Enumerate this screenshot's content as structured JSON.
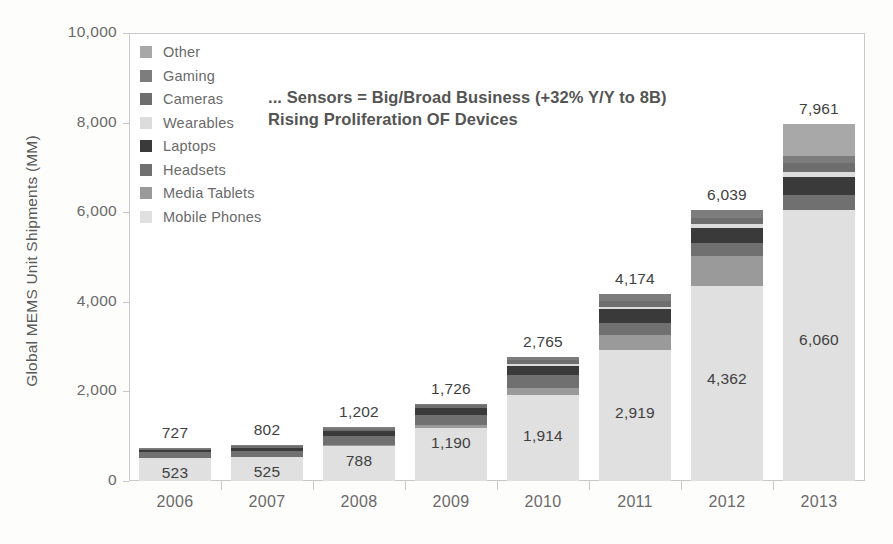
{
  "headline": {
    "line1": "... Sensors = Big/Broad Business (+32% Y/Y to 8B)",
    "line2": "Rising Proliferation OF Devices"
  },
  "legend": {
    "items": [
      {
        "label": "Other",
        "color": "#a8a8a8"
      },
      {
        "label": "Gaming",
        "color": "#7d7d7d"
      },
      {
        "label": "Cameras",
        "color": "#6e6e6e"
      },
      {
        "label": "Wearables",
        "color": "#dcdcdc"
      },
      {
        "label": "Laptops",
        "color": "#3a3a3a"
      },
      {
        "label": "Headsets",
        "color": "#707070"
      },
      {
        "label": "Media Tablets",
        "color": "#9a9a9a"
      },
      {
        "label": "Mobile Phones",
        "color": "#e0e0e0"
      }
    ]
  },
  "chart_data": {
    "type": "bar",
    "stacked": true,
    "title": "... Sensors = Big/Broad Business (+32% Y/Y to 8B) Rising Proliferation OF Devices",
    "xlabel": "",
    "ylabel": "Global MEMS Unit Shipments (MM)",
    "ylim": [
      0,
      10000
    ],
    "yticks": [
      0,
      2000,
      4000,
      6000,
      8000,
      10000
    ],
    "ytick_labels": [
      "0",
      "2,000",
      "4,000",
      "6,000",
      "8,000",
      "10,000"
    ],
    "grid": false,
    "legend_position": "upper-left inside",
    "categories": [
      "2006",
      "2007",
      "2008",
      "2009",
      "2010",
      "2011",
      "2012",
      "2013"
    ],
    "series": [
      {
        "name": "Mobile Phones",
        "color": "#e0e0e0",
        "values": [
          523,
          525,
          788,
          1190,
          1914,
          2919,
          4362,
          6060
        ]
      },
      {
        "name": "Media Tablets",
        "color": "#9a9a9a",
        "values": [
          0,
          0,
          20,
          60,
          160,
          330,
          660,
          0
        ]
      },
      {
        "name": "Headsets",
        "color": "#707070",
        "values": [
          120,
          150,
          190,
          230,
          300,
          280,
          300,
          330
        ]
      },
      {
        "name": "Laptops",
        "color": "#3a3a3a",
        "values": [
          40,
          60,
          110,
          140,
          200,
          300,
          330,
          400
        ]
      },
      {
        "name": "Wearables",
        "color": "#dcdcdc",
        "values": [
          0,
          0,
          0,
          0,
          30,
          60,
          80,
          110
        ]
      },
      {
        "name": "Cameras",
        "color": "#6e6e6e",
        "values": [
          30,
          45,
          60,
          70,
          90,
          140,
          150,
          190
        ]
      },
      {
        "name": "Gaming",
        "color": "#7d7d7d",
        "values": [
          14,
          22,
          34,
          36,
          71,
          145,
          157,
          171
        ]
      },
      {
        "name": "Other",
        "color": "#a8a8a8",
        "values": [
          0,
          0,
          0,
          0,
          0,
          0,
          0,
          700
        ]
      }
    ],
    "totals": [
      727,
      802,
      1202,
      1726,
      2765,
      4174,
      6039,
      7961
    ],
    "total_labels": [
      "727",
      "802",
      "1,202",
      "1,726",
      "2,765",
      "4,174",
      "6,039",
      "7,961"
    ],
    "base_labels": [
      "523",
      "525",
      "788",
      "1,190",
      "1,914",
      "2,919",
      "4,362",
      "6,060"
    ]
  }
}
